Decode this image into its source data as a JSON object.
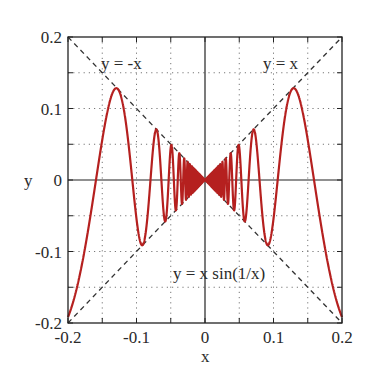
{
  "chart_data": {
    "type": "line",
    "title": "",
    "xlabel": "x",
    "ylabel": "y",
    "xlim": [
      -0.2,
      0.2
    ],
    "ylim": [
      -0.2,
      0.2
    ],
    "grid": true,
    "grid_style": "dotted",
    "x_ticks": [
      "-0.2",
      "-0.1",
      "0",
      "0.1",
      "0.2"
    ],
    "y_ticks": [
      "0.2",
      "0.1",
      "0",
      "-0.1",
      "-0.2"
    ],
    "x_tick_values": [
      -0.2,
      -0.1,
      0,
      0.1,
      0.2
    ],
    "y_tick_values": [
      0.2,
      0.1,
      0,
      -0.1,
      -0.2
    ],
    "minor_grid_step": 0.05,
    "series": [
      {
        "name": "y = x sin(1/x)",
        "function": "x*sin(1/x)",
        "style": "solid",
        "color": "#b22222"
      },
      {
        "name": "y = x",
        "function": "x",
        "style": "dashed",
        "color": "#333333"
      },
      {
        "name": "y = -x",
        "function": "-x",
        "style": "dashed",
        "color": "#333333"
      }
    ],
    "annotations": [
      {
        "text": "y = -x",
        "x": -0.12,
        "y": 0.165
      },
      {
        "text": "y = x",
        "x": 0.1,
        "y": 0.165
      },
      {
        "text": "y = x sin(1/x)",
        "x": 0.055,
        "y": -0.13
      }
    ],
    "sample_points": [
      {
        "x": -0.2,
        "y": -0.192
      },
      {
        "x": -0.13,
        "y": 0.129
      },
      {
        "x": -0.09,
        "y": -0.089
      },
      {
        "x": 0,
        "y": 0
      },
      {
        "x": 0.09,
        "y": -0.089
      },
      {
        "x": 0.13,
        "y": 0.129
      },
      {
        "x": 0.2,
        "y": -0.192
      }
    ]
  },
  "labels": {
    "xlabel": "x",
    "ylabel": "y",
    "ann_neg": "y = -x",
    "ann_pos": "y = x",
    "ann_func": "y = x sin(1/x)"
  }
}
